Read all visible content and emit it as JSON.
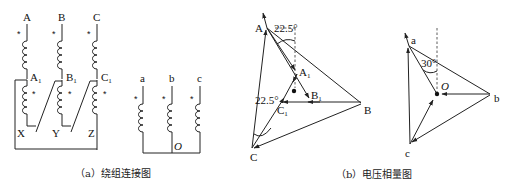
{
  "figure_a": {
    "caption": "（a）绕组连接图",
    "primary_terminals": [
      "A",
      "B",
      "C"
    ],
    "tap_labels": [
      "A",
      "B",
      "C"
    ],
    "tap_subscript": "1",
    "end_terminals": [
      "X",
      "Y",
      "Z"
    ],
    "secondary_terminals": [
      "a",
      "b",
      "c"
    ],
    "neutral_label": "O",
    "polarity_mark": "*"
  },
  "figure_b": {
    "caption": "（b）电压相量图",
    "primary_vertices": [
      "A",
      "B",
      "C"
    ],
    "tap_points": [
      "A",
      "B",
      "C"
    ],
    "tap_subscript": "1",
    "angle_top": "22.5°",
    "angle_left": "22.5°",
    "secondary_vertices": [
      "a",
      "b",
      "c"
    ],
    "secondary_neutral": "O",
    "secondary_angle": "30°"
  }
}
